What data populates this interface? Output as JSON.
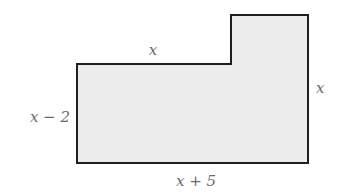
{
  "diagram": {
    "type": "composite-rectangle",
    "fill_color": "#ececec",
    "stroke_color": "#1f1f1f",
    "label_color": "#6b6b6b",
    "labels": {
      "top": "x",
      "left": "x − 2",
      "right": "x",
      "bottom": "x + 5"
    }
  }
}
